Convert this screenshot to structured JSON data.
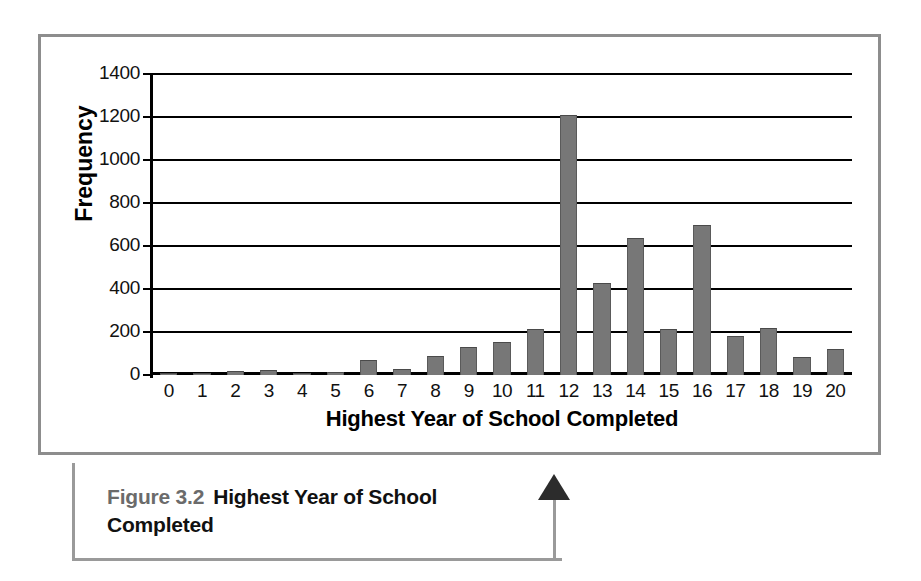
{
  "figure": {
    "caption_label": "Figure 3.2",
    "caption_title": "Highest Year of School Completed",
    "border_color": "#8d8d8d",
    "callout_color": "#9a9a9a",
    "arrow_color": "#2c2c2c"
  },
  "chart_data": {
    "type": "bar",
    "title": "",
    "xlabel": "Highest Year of School Completed",
    "ylabel": "Frequency",
    "categories": [
      "0",
      "1",
      "2",
      "3",
      "4",
      "5",
      "6",
      "7",
      "8",
      "9",
      "10",
      "11",
      "12",
      "13",
      "14",
      "15",
      "16",
      "17",
      "18",
      "19",
      "20"
    ],
    "values": [
      10,
      2,
      20,
      22,
      5,
      15,
      72,
      30,
      90,
      130,
      155,
      215,
      1210,
      430,
      635,
      215,
      700,
      180,
      220,
      85,
      120
    ],
    "ylim": [
      0,
      1400
    ],
    "ytick_labels": [
      "1400",
      "1200",
      "1000",
      "800",
      "600",
      "400",
      "200",
      "0"
    ],
    "ytick_values": [
      1400,
      1200,
      1000,
      800,
      600,
      400,
      200,
      0
    ],
    "grid": true,
    "legend": "none",
    "bar_color": "#777777",
    "axis_color": "#000000"
  }
}
